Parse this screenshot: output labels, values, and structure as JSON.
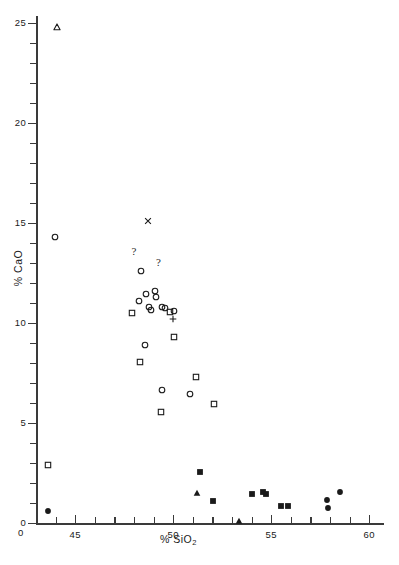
{
  "figure": {
    "width": 399,
    "height": 565,
    "background": "#ffffff",
    "ink_color": "#1a1a1a"
  },
  "chart_data": {
    "type": "scatter",
    "title": "",
    "xlabel": "% SiO2",
    "xlabel_parts": {
      "prefix": "% SiO",
      "subscript": "2"
    },
    "ylabel": "% CaO",
    "xlim": [
      43.0,
      60.0
    ],
    "ylim": [
      0,
      25.4
    ],
    "grid": false,
    "legend": "none",
    "x_ticks_major": [
      45,
      50,
      55,
      60
    ],
    "x_tick_labels": [
      "45",
      "50",
      "55",
      "60"
    ],
    "x_ticks_minor": [
      44,
      46,
      47,
      48,
      49,
      51,
      52,
      53,
      54,
      56,
      57,
      58,
      59
    ],
    "y_ticks_major": [
      0,
      5,
      10,
      15,
      20,
      25
    ],
    "y_tick_labels": [
      "0",
      "5",
      "10",
      "15",
      "20",
      "25"
    ],
    "y_ticks_minor": [
      1,
      2,
      3,
      4,
      6,
      7,
      8,
      9,
      11,
      12,
      13,
      14,
      16,
      17,
      18,
      19,
      21,
      22,
      23,
      24
    ],
    "series": [
      {
        "name": "open-triangle",
        "marker": "open-triangle",
        "points": [
          {
            "x": 44.05,
            "y": 24.8
          }
        ]
      },
      {
        "name": "cross-x",
        "marker": "cross-x",
        "points": [
          {
            "x": 48.7,
            "y": 15.1
          }
        ]
      },
      {
        "name": "plus",
        "marker": "plus",
        "points": [
          {
            "x": 50.0,
            "y": 10.2
          }
        ]
      },
      {
        "name": "open-circle",
        "marker": "open-circle",
        "points": [
          {
            "x": 43.95,
            "y": 14.3
          },
          {
            "x": 48.35,
            "y": 12.6
          },
          {
            "x": 49.05,
            "y": 11.6
          },
          {
            "x": 48.6,
            "y": 11.45
          },
          {
            "x": 49.1,
            "y": 11.3
          },
          {
            "x": 48.25,
            "y": 11.1
          },
          {
            "x": 48.75,
            "y": 10.8
          },
          {
            "x": 48.85,
            "y": 10.65
          },
          {
            "x": 49.45,
            "y": 10.8
          },
          {
            "x": 49.6,
            "y": 10.75
          },
          {
            "x": 50.05,
            "y": 10.6
          },
          {
            "x": 48.55,
            "y": 8.9
          },
          {
            "x": 49.45,
            "y": 6.65
          },
          {
            "x": 50.85,
            "y": 6.45
          }
        ]
      },
      {
        "name": "open-square",
        "marker": "open-square",
        "points": [
          {
            "x": 43.6,
            "y": 2.9
          },
          {
            "x": 47.9,
            "y": 10.5
          },
          {
            "x": 49.85,
            "y": 10.55
          },
          {
            "x": 50.05,
            "y": 9.3
          },
          {
            "x": 48.3,
            "y": 8.05
          },
          {
            "x": 51.15,
            "y": 7.3
          },
          {
            "x": 49.4,
            "y": 5.55
          },
          {
            "x": 52.1,
            "y": 5.95
          }
        ]
      },
      {
        "name": "filled-circle",
        "marker": "filled-circle",
        "points": [
          {
            "x": 43.6,
            "y": 0.6
          },
          {
            "x": 57.85,
            "y": 1.15
          },
          {
            "x": 57.9,
            "y": 0.75
          },
          {
            "x": 58.5,
            "y": 1.55
          }
        ]
      },
      {
        "name": "filled-square",
        "marker": "filled-square",
        "points": [
          {
            "x": 51.35,
            "y": 2.55
          },
          {
            "x": 52.05,
            "y": 1.1
          },
          {
            "x": 54.0,
            "y": 1.45
          },
          {
            "x": 54.6,
            "y": 1.55
          },
          {
            "x": 54.75,
            "y": 1.45
          },
          {
            "x": 55.5,
            "y": 0.85
          },
          {
            "x": 55.85,
            "y": 0.85
          }
        ]
      },
      {
        "name": "filled-triangle",
        "marker": "filled-triangle",
        "points": [
          {
            "x": 51.2,
            "y": 1.5
          },
          {
            "x": 53.35,
            "y": 0.1
          }
        ]
      }
    ],
    "annotations": [
      {
        "text": "?",
        "x": 48.0,
        "y": 13.6
      },
      {
        "text": "?",
        "x": 49.25,
        "y": 13.05
      }
    ]
  }
}
